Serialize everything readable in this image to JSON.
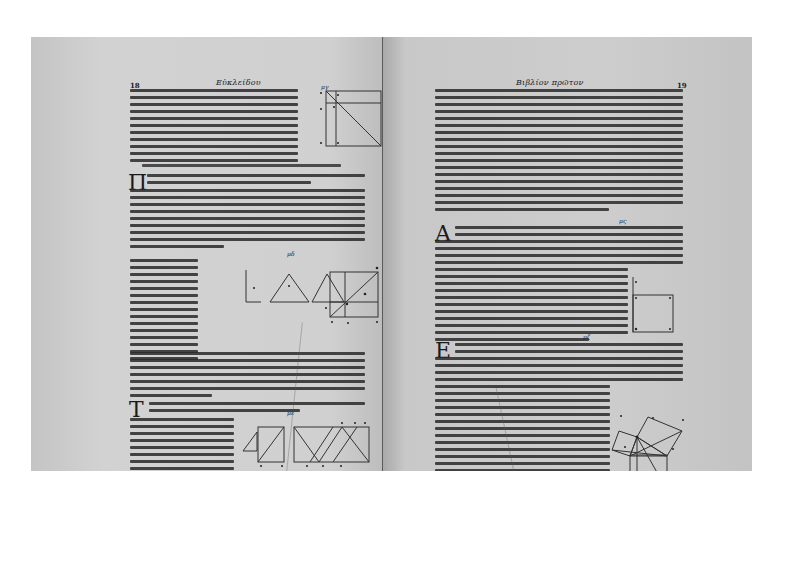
{
  "document": {
    "type": "scanned book spread",
    "language": "Greek",
    "left_page": {
      "folio": "18",
      "running_head": "Εὐκλείδου",
      "dropcaps": [
        "Π",
        "Τ"
      ],
      "proposition_marks": [
        "μγ",
        "μδ",
        "με"
      ]
    },
    "right_page": {
      "folio": "19",
      "running_head": "Βιβλίον πρῶτον",
      "dropcaps": [
        "Α",
        "Ε"
      ],
      "proposition_marks": [
        "μς",
        "μζ"
      ],
      "footer_signature": "β  +",
      "catchword": "γωνίας"
    }
  }
}
